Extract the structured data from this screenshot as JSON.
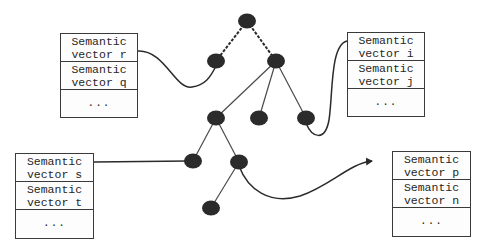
{
  "diagram": {
    "boxes": [
      {
        "id": "top-left",
        "x": 60,
        "y": 33,
        "w": 78,
        "h": 85,
        "rows": [
          {
            "line1": "Semantic",
            "line2": "vector r"
          },
          {
            "line1": "Semantic",
            "line2": "vector q"
          }
        ],
        "more": "..."
      },
      {
        "id": "top-right",
        "x": 347,
        "y": 32,
        "w": 78,
        "h": 85,
        "rows": [
          {
            "line1": "Semantic",
            "line2": "vector i"
          },
          {
            "line1": "Semantic",
            "line2": "vector j"
          }
        ],
        "more": "..."
      },
      {
        "id": "bottom-left",
        "x": 15,
        "y": 153,
        "w": 79,
        "h": 86,
        "rows": [
          {
            "line1": "Semantic",
            "line2": "vector s"
          },
          {
            "line1": "Semantic",
            "line2": "vector t"
          }
        ],
        "more": "..."
      },
      {
        "id": "bottom-right",
        "x": 392,
        "y": 151,
        "w": 79,
        "h": 86,
        "rows": [
          {
            "line1": "Semantic",
            "line2": "vector p"
          },
          {
            "line1": "Semantic",
            "line2": "vector n"
          }
        ],
        "more": "..."
      }
    ],
    "nodes": [
      {
        "id": "root",
        "cx": 247,
        "cy": 21
      },
      {
        "id": "l1-left",
        "cx": 216,
        "cy": 61
      },
      {
        "id": "l1-right",
        "cx": 276,
        "cy": 61
      },
      {
        "id": "l2-a",
        "cx": 216,
        "cy": 118
      },
      {
        "id": "l2-b",
        "cx": 259,
        "cy": 118
      },
      {
        "id": "l2-c",
        "cx": 306,
        "cy": 118
      },
      {
        "id": "l3-a",
        "cx": 193,
        "cy": 161
      },
      {
        "id": "l3-b",
        "cx": 239,
        "cy": 162
      },
      {
        "id": "l4-a",
        "cx": 211,
        "cy": 208
      }
    ],
    "edges": [
      {
        "from": "root",
        "to": "l1-left",
        "style": "dashed"
      },
      {
        "from": "root",
        "to": "l1-right",
        "style": "dashed"
      },
      {
        "from": "l1-right",
        "to": "l2-a",
        "style": "solid"
      },
      {
        "from": "l1-right",
        "to": "l2-b",
        "style": "solid"
      },
      {
        "from": "l1-right",
        "to": "l2-c",
        "style": "solid"
      },
      {
        "from": "l2-a",
        "to": "l3-a",
        "style": "solid"
      },
      {
        "from": "l2-a",
        "to": "l3-b",
        "style": "solid"
      },
      {
        "from": "l3-b",
        "to": "l4-a",
        "style": "solid"
      }
    ],
    "links": [
      {
        "id": "link-r-to-l1-left",
        "d": "M138,51 C165,50 175,90 192,87 C205,85 210,78 216,66",
        "arrow": false
      },
      {
        "id": "link-l2c-to-i",
        "d": "M306,123 C312,138 325,142 329,120 C333,95 330,45 347,41",
        "arrow": false
      },
      {
        "id": "link-s-to-l3a",
        "d": "M94,162 L188,161",
        "arrow": false
      },
      {
        "id": "link-l3b-to-p",
        "d": "M239,166 C248,190 270,205 300,196 C330,186 350,163 372,161",
        "arrow": true
      }
    ],
    "colors": {
      "node": "#2b2b2b",
      "line": "#4a4a4a",
      "box_border": "#3a3a3a"
    }
  }
}
